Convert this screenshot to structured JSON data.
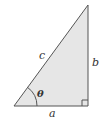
{
  "diagram": {
    "type": "right-triangle",
    "fill_color": "#e6e6e6",
    "stroke_color": "#555555",
    "vertices": {
      "bottom_left": [
        14,
        106
      ],
      "bottom_right": [
        88,
        106
      ],
      "top": [
        88,
        5
      ]
    },
    "labels": {
      "hypotenuse": "c",
      "opposite": "b",
      "adjacent": "a",
      "angle": "θ"
    },
    "right_angle_marker": true
  }
}
